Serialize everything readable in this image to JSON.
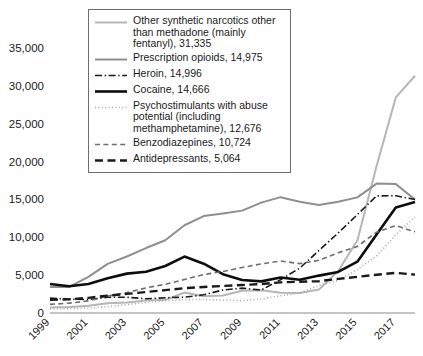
{
  "chart_data": {
    "type": "line",
    "title": "",
    "xlabel": "",
    "ylabel": "",
    "grid": false,
    "legend_position": "top-center-inside",
    "x": [
      1999,
      2000,
      2001,
      2002,
      2003,
      2004,
      2005,
      2006,
      2007,
      2008,
      2009,
      2010,
      2011,
      2012,
      2013,
      2014,
      2015,
      2016,
      2017,
      2018
    ],
    "xtick_labels": [
      "1999",
      "2001",
      "2003",
      "2005",
      "2007",
      "2009",
      "2011",
      "2013",
      "2015",
      "2017"
    ],
    "xtick_values": [
      1999,
      2001,
      2003,
      2005,
      2007,
      2009,
      2011,
      2013,
      2015,
      2017
    ],
    "ytick_labels": [
      "0",
      "5,000",
      "10,000",
      "15,000",
      "20,000",
      "25,000",
      "30,000",
      "35,000"
    ],
    "ytick_values": [
      0,
      5000,
      10000,
      15000,
      20000,
      25000,
      30000,
      35000
    ],
    "ylim": [
      0,
      35000
    ],
    "xlim": [
      1999,
      2018
    ],
    "series": [
      {
        "name": "Other synthetic narcotics other than methadone (mainly fentanyl)",
        "final_value": 31335,
        "legend_label": "Other synthetic narcotics other than methadone (mainly fentanyl), 31,335",
        "style": "solid",
        "color": "#b6b6b6",
        "width": 2.0,
        "values": [
          730,
          780,
          950,
          1290,
          1400,
          1660,
          1740,
          2710,
          2210,
          2310,
          2950,
          3000,
          2670,
          2630,
          3100,
          5540,
          9580,
          19410,
          28470,
          31335
        ]
      },
      {
        "name": "Prescription opioids",
        "final_value": 14975,
        "legend_label": "Prescription opioids, 14,975",
        "style": "solid",
        "color": "#8f8f8f",
        "width": 2.0,
        "values": [
          3440,
          3450,
          4770,
          6480,
          7460,
          8580,
          9610,
          11590,
          12800,
          13150,
          13520,
          14580,
          15300,
          14700,
          14260,
          14700,
          15270,
          17090,
          17030,
          14975
        ]
      },
      {
        "name": "Heroin",
        "final_value": 14996,
        "legend_label": "Heroin, 14,996",
        "style": "dashdot",
        "color": "#1a1a1a",
        "width": 1.6,
        "values": [
          1960,
          1840,
          1760,
          2090,
          2080,
          1880,
          2010,
          2090,
          2400,
          3040,
          3280,
          3040,
          4400,
          5930,
          8260,
          10570,
          12990,
          15470,
          15480,
          14996
        ]
      },
      {
        "name": "Cocaine",
        "final_value": 14666,
        "legend_label": "Cocaine, 14,666",
        "style": "solid",
        "color": "#0d0d0d",
        "width": 2.6,
        "values": [
          3820,
          3530,
          3830,
          4600,
          5200,
          5440,
          6210,
          7450,
          6510,
          5130,
          4350,
          4180,
          4680,
          4400,
          4940,
          5420,
          6780,
          10380,
          13940,
          14666
        ]
      },
      {
        "name": "Psychostimulants with abuse potential (including methamphetamine)",
        "final_value": 12676,
        "legend_label": "Psychostimulants with abuse potential (including methamphetamine), 12,676",
        "style": "dotted",
        "color": "#a8a8a8",
        "width": 1.6,
        "values": [
          550,
          580,
          660,
          830,
          1110,
          1380,
          1610,
          1770,
          1780,
          1720,
          1630,
          1850,
          2270,
          2640,
          3630,
          4300,
          5720,
          7540,
          10330,
          12676
        ]
      },
      {
        "name": "Benzodiazepines",
        "final_value": 10724,
        "legend_label": "Benzodiazepines, 10,724",
        "style": "dashed",
        "color": "#6e6e6e",
        "width": 1.6,
        "values": [
          1140,
          1300,
          1600,
          2230,
          2700,
          3320,
          3790,
          4430,
          5080,
          5480,
          6010,
          6490,
          6870,
          6520,
          6970,
          7950,
          8790,
          10680,
          11540,
          10724
        ]
      },
      {
        "name": "Antidepressants",
        "final_value": 5064,
        "legend_label": "Antidepressants, 5,064",
        "style": "dashed-long",
        "color": "#1a1a1a",
        "width": 2.4,
        "values": [
          1750,
          1800,
          2000,
          2300,
          2520,
          2770,
          3020,
          3280,
          3440,
          3570,
          3700,
          3820,
          4050,
          4130,
          4200,
          4510,
          4770,
          5050,
          5300,
          5064
        ]
      }
    ]
  },
  "legend": {
    "items": [
      {
        "label": "Other synthetic narcotics other than methadone (mainly fentanyl), 31,335",
        "swatch": "solid-light-gray"
      },
      {
        "label": "Prescription opioids, 14,975",
        "swatch": "solid-gray"
      },
      {
        "label": "Heroin, 14,996",
        "swatch": "dashdot-black"
      },
      {
        "label": "Cocaine, 14,666",
        "swatch": "solid-thick-black"
      },
      {
        "label": "Psychostimulants with abuse potential (including methamphetamine), 12,676",
        "swatch": "dotted-gray"
      },
      {
        "label": "Benzodiazepines, 10,724",
        "swatch": "dashed-gray"
      },
      {
        "label": "Antidepressants, 5,064",
        "swatch": "dashed-long-black"
      }
    ]
  }
}
